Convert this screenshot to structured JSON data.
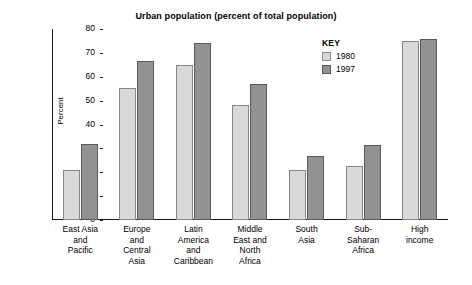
{
  "chart_data": {
    "type": "bar",
    "title": "Urban population (percent of total population)",
    "xlabel": "",
    "ylabel": "Percent",
    "ylim": [
      0,
      80
    ],
    "yticks": [
      0,
      10,
      20,
      30,
      40,
      50,
      60,
      70,
      80
    ],
    "grid": false,
    "legend_position": "inside-top-right",
    "legend_title": "KEY",
    "categories": [
      "East Asia\nand\nPacific",
      "Europe\nand\nCentral\nAsia",
      "Latin\nAmerica\nand\nCaribbean",
      "Middle\nEast and\nNorth\nAfrica",
      "South\nAsia",
      "Sub-\nSaharan\nAfrica",
      "High\nincome"
    ],
    "series": [
      {
        "name": "1980",
        "color": "#d9d9d9",
        "values": [
          21,
          55.5,
          65,
          48,
          21,
          22.5,
          75
        ]
      },
      {
        "name": "1997",
        "color": "#929292",
        "values": [
          32,
          66.5,
          74,
          57,
          27,
          31.5,
          76
        ]
      }
    ]
  }
}
